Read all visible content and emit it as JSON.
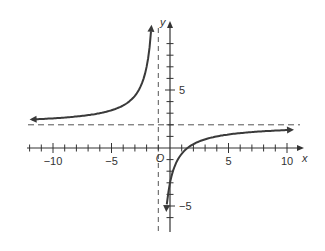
{
  "chart_data": {
    "type": "line",
    "title": "",
    "function": "y = 2 - 5/(x + 1)",
    "xlabel": "x",
    "ylabel": "y",
    "origin_label": "O",
    "xlim": [
      -12,
      11
    ],
    "ylim": [
      -6.5,
      10
    ],
    "x_tick_labels": [
      "−10",
      "−5",
      "5",
      "10"
    ],
    "x_tick_label_values": [
      -10,
      -5,
      5,
      10
    ],
    "y_tick_labels": [
      "5",
      "−5"
    ],
    "y_tick_label_values": [
      5,
      -5
    ],
    "asymptotes": {
      "vertical": -1,
      "horizontal": 2
    },
    "grid": false,
    "series": [
      {
        "name": "left branch",
        "x": [
          -12,
          -10,
          -8,
          -6,
          -5,
          -4,
          -3,
          -2.5,
          -2,
          -1.7
        ],
        "y": [
          2.45,
          2.56,
          2.71,
          3,
          3.25,
          3.67,
          4.5,
          5.33,
          7,
          9.14
        ]
      },
      {
        "name": "right branch",
        "x": [
          -0.4,
          0,
          0.5,
          1,
          1.5,
          2,
          3,
          5,
          7,
          10.5
        ],
        "y": [
          -6.33,
          -3,
          -1.33,
          -0.5,
          0,
          0.33,
          0.75,
          1.17,
          1.38,
          1.58
        ]
      }
    ],
    "colors": {
      "curve": "#3a3a3a",
      "axes": "#333333",
      "asymptote": "#555555"
    }
  }
}
